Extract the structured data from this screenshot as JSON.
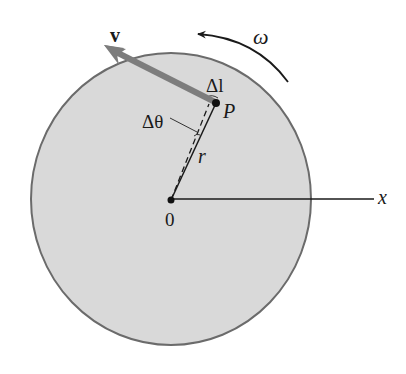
{
  "figure": {
    "type": "rotating-disk-kinematics",
    "labels": {
      "velocity": "v",
      "angular_velocity": "ω",
      "arc_length": "Δl",
      "point": "P",
      "angle": "Δθ",
      "radius": "r",
      "origin": "0",
      "x_axis": "x"
    },
    "colors": {
      "disk_fill": "#d9d9d9",
      "disk_edge": "#6b6b6b",
      "velocity_arrow": "#7d7d7d",
      "lines": "#1a1a1a",
      "background": "#ffffff"
    },
    "geometry": {
      "disk_center": [
        171,
        199
      ],
      "disk_radius_x": 140,
      "disk_radius_y": 146,
      "origin_point": [
        171,
        200
      ],
      "point_P": [
        216,
        103
      ],
      "velocity_tip": [
        104,
        45
      ],
      "x_axis_end": [
        374,
        199
      ]
    }
  }
}
